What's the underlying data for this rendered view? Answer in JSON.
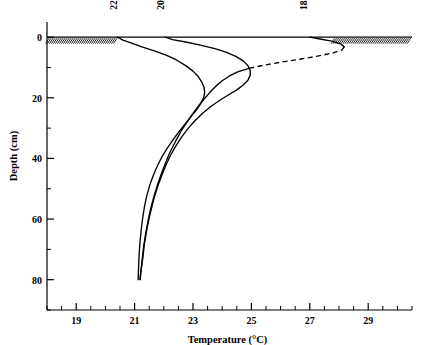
{
  "chart_data": {
    "type": "line",
    "title": "",
    "xlabel": "Temperature (°C)",
    "ylabel": "Depth (cm)",
    "xlim": [
      18.0,
      30.5
    ],
    "ylim": [
      -5,
      90
    ],
    "y_inverted": true,
    "grid": false,
    "legend_position": "inline-curve-labels",
    "xticks": [
      19,
      21,
      23,
      25,
      27,
      29
    ],
    "xtick_labels": [
      "19",
      "21",
      "23",
      "25",
      "27",
      "29"
    ],
    "xminor_step": 0.5,
    "yticks": [
      0,
      20,
      40,
      60,
      80
    ],
    "ytick_labels": [
      "0",
      "20",
      "40",
      "60",
      "80"
    ],
    "yminor_step": 10,
    "surface_depth": 0,
    "surface_hatch": true,
    "series": [
      {
        "name": "2230",
        "label": "2230",
        "label_temp": 20.4,
        "label_depth": -9,
        "style": "solid",
        "points": [
          [
            20.42,
            0.0
          ],
          [
            20.6,
            1.0
          ],
          [
            20.9,
            2.0
          ],
          [
            21.25,
            3.2
          ],
          [
            21.7,
            4.6
          ],
          [
            22.1,
            6.0
          ],
          [
            22.45,
            7.6
          ],
          [
            22.75,
            9.4
          ],
          [
            23.0,
            11.2
          ],
          [
            23.18,
            13.0
          ],
          [
            23.3,
            14.8
          ],
          [
            23.38,
            16.6
          ],
          [
            23.4,
            18.4
          ],
          [
            23.36,
            20.0
          ],
          [
            23.26,
            22.0
          ],
          [
            23.1,
            24.2
          ],
          [
            22.92,
            26.4
          ],
          [
            22.72,
            28.8
          ],
          [
            22.52,
            31.2
          ],
          [
            22.32,
            33.8
          ],
          [
            22.12,
            36.6
          ],
          [
            21.94,
            39.4
          ],
          [
            21.78,
            42.4
          ],
          [
            21.64,
            45.6
          ],
          [
            21.52,
            48.8
          ],
          [
            21.42,
            52.2
          ],
          [
            21.34,
            55.8
          ],
          [
            21.28,
            59.4
          ],
          [
            21.23,
            63.2
          ],
          [
            21.19,
            67.0
          ],
          [
            21.16,
            71.0
          ],
          [
            21.14,
            75.0
          ],
          [
            21.12,
            80.0
          ]
        ]
      },
      {
        "name": "2030",
        "label": "2030",
        "label_temp": 22.0,
        "label_depth": -9,
        "style": "solid",
        "points": [
          [
            22.05,
            0.0
          ],
          [
            22.3,
            0.8
          ],
          [
            22.75,
            1.6
          ],
          [
            23.25,
            2.6
          ],
          [
            23.75,
            3.8
          ],
          [
            24.15,
            5.0
          ],
          [
            24.48,
            6.4
          ],
          [
            24.72,
            7.8
          ],
          [
            24.88,
            9.4
          ],
          [
            24.96,
            11.0
          ],
          [
            24.96,
            12.6
          ],
          [
            24.88,
            14.2
          ],
          [
            24.72,
            15.8
          ],
          [
            24.5,
            17.4
          ],
          [
            24.22,
            19.0
          ],
          [
            23.92,
            20.8
          ],
          [
            23.62,
            22.8
          ],
          [
            23.34,
            25.0
          ],
          [
            23.08,
            27.4
          ],
          [
            22.84,
            30.0
          ],
          [
            22.62,
            32.8
          ],
          [
            22.42,
            35.8
          ],
          [
            22.24,
            38.8
          ],
          [
            22.08,
            42.0
          ],
          [
            21.94,
            45.4
          ],
          [
            21.8,
            49.0
          ],
          [
            21.68,
            52.6
          ],
          [
            21.58,
            56.4
          ],
          [
            21.48,
            60.4
          ],
          [
            21.4,
            64.4
          ],
          [
            21.33,
            68.6
          ],
          [
            21.28,
            73.0
          ],
          [
            21.22,
            77.0
          ],
          [
            21.18,
            80.0
          ]
        ]
      },
      {
        "name": "1830",
        "label": "1830",
        "label_temp": 26.9,
        "label_depth": -9,
        "style": "solid-with-dashed-segment",
        "dash_start_index": 4,
        "dash_end_index": 11,
        "points": [
          [
            27.0,
            0.0
          ],
          [
            27.35,
            0.6
          ],
          [
            27.75,
            1.3
          ],
          [
            28.05,
            2.2
          ],
          [
            28.18,
            3.2
          ],
          [
            28.1,
            4.2
          ],
          [
            27.8,
            5.2
          ],
          [
            27.3,
            6.2
          ],
          [
            26.7,
            7.2
          ],
          [
            26.05,
            8.2
          ],
          [
            25.45,
            9.2
          ],
          [
            24.95,
            10.2
          ],
          [
            24.55,
            11.4
          ],
          [
            24.25,
            12.8
          ],
          [
            24.0,
            14.4
          ],
          [
            23.78,
            16.2
          ],
          [
            23.58,
            18.2
          ],
          [
            23.38,
            20.4
          ],
          [
            23.18,
            22.8
          ],
          [
            22.98,
            25.4
          ],
          [
            22.78,
            28.2
          ],
          [
            22.58,
            31.2
          ],
          [
            22.4,
            34.4
          ],
          [
            22.22,
            37.8
          ],
          [
            22.06,
            41.4
          ],
          [
            21.92,
            45.0
          ],
          [
            21.78,
            48.8
          ],
          [
            21.66,
            52.6
          ],
          [
            21.55,
            56.6
          ],
          [
            21.46,
            60.6
          ],
          [
            21.38,
            64.8
          ],
          [
            21.31,
            69.0
          ],
          [
            21.26,
            73.4
          ],
          [
            21.22,
            77.0
          ],
          [
            21.19,
            80.0
          ]
        ]
      }
    ]
  }
}
